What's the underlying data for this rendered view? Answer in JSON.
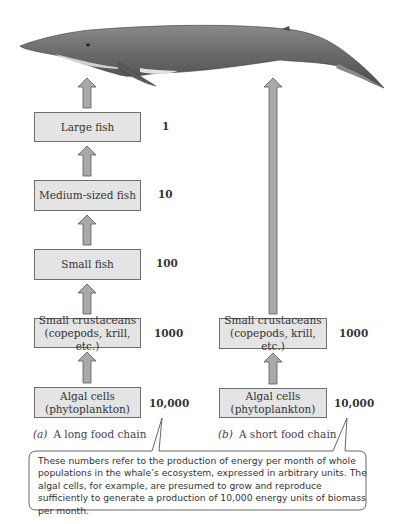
{
  "figure": {
    "chain_a": {
      "caption_letter": "(a)",
      "caption_text": "A long food chain",
      "levels": [
        {
          "label_lines": [
            "Large fish"
          ],
          "value": "1"
        },
        {
          "label_lines": [
            "Medium-sized fish"
          ],
          "value": "10"
        },
        {
          "label_lines": [
            "Small fish"
          ],
          "value": "100"
        },
        {
          "label_lines": [
            "Small crustaceans",
            "(copepods, krill, etc.)"
          ],
          "value": "1000"
        },
        {
          "label_lines": [
            "Algal cells",
            "(phytoplankton)"
          ],
          "value": "10,000"
        }
      ]
    },
    "chain_b": {
      "caption_letter": "(b)",
      "caption_text": "A short food chain",
      "levels": [
        {
          "label_lines": [
            "Small crustaceans",
            "(copepods, krill, etc.)"
          ],
          "value": "1000"
        },
        {
          "label_lines": [
            "Algal cells",
            "(phytoplankton)"
          ],
          "value": "10,000"
        }
      ]
    },
    "callout": "These numbers refer to the production of energy per month of whole populations in the whale’s ecosystem, expressed in arbitrary units. The algal cells, for example, are presumed to grow and reproduce sufficiently to generate a production of 10,000 energy units of biomass per month.",
    "colors": {
      "box_fill": "#e4e4e4",
      "arrow_fill": "#a9a9a9",
      "whale_body": "#6f6f6f",
      "whale_belly": "#d8d8d8"
    }
  }
}
